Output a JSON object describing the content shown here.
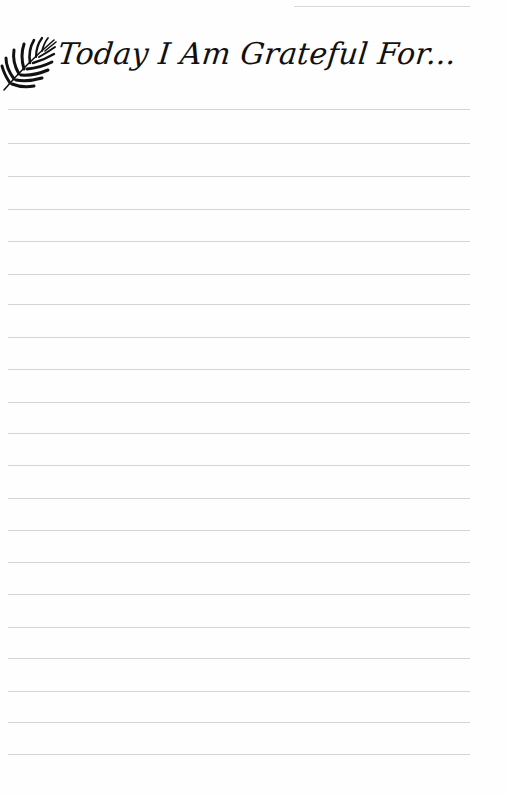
{
  "page": {
    "title": "Today I Am Grateful For...",
    "icon": "palm-leaf-icon",
    "line_count": 21,
    "line_positions": [
      109,
      143,
      176,
      209,
      241,
      274,
      304,
      337,
      369,
      402,
      433,
      465,
      498,
      530,
      562,
      594,
      627,
      658,
      691,
      722,
      754
    ],
    "line_color": "#d4d4d4",
    "text_color": "#111111"
  }
}
